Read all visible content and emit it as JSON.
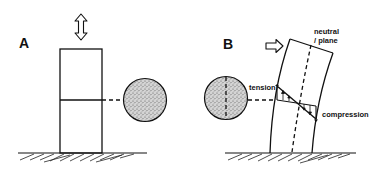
{
  "figure": {
    "colors": {
      "ink": "#111111",
      "stipple": "#8a8a8a",
      "background": "#ffffff"
    }
  },
  "panel_a": {
    "label": "A",
    "load_arrow": "vertical-double-arrow",
    "cross_section": "stippled-circle"
  },
  "panel_b": {
    "label": "B",
    "load_arrow": "horizontal-right-arrow",
    "labels": {
      "neutral_plane_line1": "neutral",
      "neutral_plane_line2": "/ plane",
      "tension": "tension",
      "compression": "compression"
    },
    "cross_section": "stippled-circle-with-neutral-axis"
  }
}
